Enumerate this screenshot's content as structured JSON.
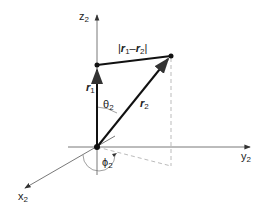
{
  "diagram": {
    "axes": {
      "z": {
        "label": "z",
        "sub": "2"
      },
      "y": {
        "label": "y",
        "sub": "2"
      },
      "x": {
        "label": "x",
        "sub": "2"
      }
    },
    "vectors": {
      "r1": {
        "label": "r",
        "sub": "1"
      },
      "r2": {
        "label": "r",
        "sub": "2"
      },
      "difference": {
        "prefix": "|",
        "a": "r",
        "a_sub": "1",
        "minus": "–",
        "b": "r",
        "b_sub": "2",
        "suffix": "|"
      }
    },
    "angles": {
      "theta": {
        "label": "θ",
        "sub": "2"
      },
      "phi": {
        "label": "ϕ",
        "sub": "2"
      }
    },
    "colors": {
      "line": "#111111",
      "axis": "#555555",
      "dashed": "#aaaaaa"
    }
  }
}
